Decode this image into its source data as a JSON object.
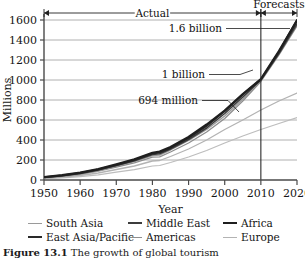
{
  "figure": {
    "caption_label": "Figure 13.1",
    "caption_text": "The growth of global tourism"
  },
  "chart_data": {
    "type": "line",
    "title": "",
    "xlabel": "Year",
    "ylabel": "Millions",
    "xlim": [
      1950,
      2020
    ],
    "ylim": [
      0,
      1600
    ],
    "xticks": [
      1950,
      1960,
      1970,
      1980,
      1990,
      2000,
      2010,
      2020
    ],
    "yticks": [
      0,
      200,
      400,
      600,
      800,
      1000,
      1200,
      1400,
      1600
    ],
    "grid": "horizontal",
    "legend_position": "below",
    "forecast_start": 2010,
    "spans": [
      {
        "label": "Actual",
        "from": 1950,
        "to": 2010
      },
      {
        "label": "Forecasts",
        "from": 2010,
        "to": 2020
      }
    ],
    "annotations": [
      {
        "label": "1.6 billion",
        "x": 2020,
        "y": 1600
      },
      {
        "label": "1 billion",
        "x": 2010,
        "y": 1000
      },
      {
        "label": "694 million",
        "x": 2000,
        "y": 694
      }
    ],
    "x": [
      1950,
      1955,
      1960,
      1965,
      1970,
      1975,
      1980,
      1982,
      1985,
      1990,
      1995,
      2000,
      2005,
      2010,
      2015,
      2020
    ],
    "series": [
      {
        "name": "South Asia",
        "color": "#9a9a9a",
        "width": 1.4,
        "values": [
          25,
          40,
          62,
          95,
          140,
          185,
          245,
          250,
          300,
          395,
          505,
          640,
          810,
          1000,
          1270,
          1580
        ]
      },
      {
        "name": "East Asia/Pacific",
        "color": "#2a2a2a",
        "width": 2.0,
        "values": [
          28,
          45,
          70,
          105,
          150,
          200,
          265,
          275,
          320,
          420,
          540,
          690,
          855,
          1005,
          1280,
          1600
        ]
      },
      {
        "name": "Middle East",
        "color": "#3c3c3c",
        "width": 1.6,
        "values": [
          26,
          42,
          66,
          100,
          145,
          192,
          255,
          262,
          310,
          405,
          520,
          665,
          830,
          1000,
          1265,
          1560
        ]
      },
      {
        "name": "Americas",
        "color": "#8e8e8e",
        "width": 1.3,
        "values": [
          22,
          36,
          56,
          88,
          130,
          172,
          228,
          232,
          280,
          370,
          480,
          615,
          790,
          985,
          1250,
          1540
        ]
      },
      {
        "name": "Africa",
        "color": "#1f1f1f",
        "width": 2.2,
        "values": [
          30,
          48,
          74,
          110,
          158,
          208,
          272,
          285,
          330,
          430,
          555,
          694,
          860,
          1010,
          1290,
          1595
        ]
      },
      {
        "name": "Europe",
        "color": "#b3b3b3",
        "width": 1.3,
        "values": [
          18,
          28,
          45,
          70,
          105,
          140,
          190,
          195,
          235,
          310,
          400,
          505,
          600,
          700,
          790,
          870
        ]
      }
    ],
    "extra_series": [
      {
        "name": "lower-trend",
        "color": "#bdbdbd",
        "width": 1.2,
        "values": [
          14,
          22,
          34,
          52,
          78,
          104,
          140,
          145,
          175,
          230,
          295,
          370,
          440,
          505,
          565,
          625
        ]
      }
    ]
  }
}
